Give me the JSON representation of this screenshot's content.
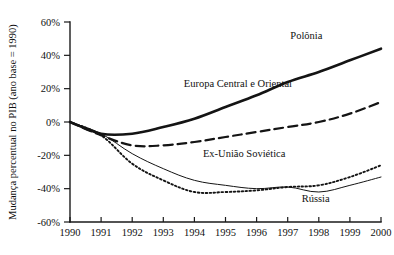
{
  "chart_data": {
    "type": "line",
    "title": "",
    "subtitle": "",
    "xlabel": "",
    "ylabel": "Mudança percentual no PIB (ano base = 1990)",
    "x": [
      1990,
      1991,
      1992,
      1993,
      1994,
      1995,
      1996,
      1997,
      1998,
      1999,
      2000
    ],
    "categories": [
      "1990",
      "1991",
      "1992",
      "1993",
      "1994",
      "1995",
      "1996",
      "1997",
      "1998",
      "1999",
      "2000"
    ],
    "xlim": [
      1990,
      2000
    ],
    "ylim": [
      -60,
      60
    ],
    "y_ticks": [
      60,
      40,
      20,
      0,
      -20,
      -40,
      -60
    ],
    "y_tick_labels": [
      "60%",
      "40%",
      "20%",
      "0%",
      "-20%",
      "-40%",
      "-60%"
    ],
    "grid": false,
    "legend_position": "inline-labels",
    "series": [
      {
        "name": "Polônia",
        "style": "solid-thick",
        "label_x": 1997.6,
        "label_y": 50,
        "values": [
          0,
          -7,
          -7,
          -3,
          2,
          9,
          16,
          24,
          30,
          37,
          44
        ]
      },
      {
        "name": "Europa Central e Oriental",
        "style": "dashed",
        "label_x": 1995.4,
        "label_y": 21,
        "values": [
          0,
          -8,
          -14,
          -14,
          -12,
          -9,
          -6,
          -3,
          0,
          5,
          12
        ]
      },
      {
        "name": "Ex-União Soviética",
        "style": "dotted",
        "label_x": 1995.6,
        "label_y": -21,
        "values": [
          0,
          -8,
          -25,
          -35,
          -42,
          -42,
          -41,
          -39,
          -38,
          -33,
          -26
        ]
      },
      {
        "name": "Rússia",
        "style": "solid-thin",
        "label_x": 1997.9,
        "label_y": -48,
        "values": [
          0,
          -7,
          -19,
          -28,
          -35,
          -38,
          -40,
          -39,
          -42,
          -38,
          -33
        ]
      }
    ]
  },
  "axes": {
    "y_axis_label": "Mudança percentual no PIB (ano base = 1990)"
  }
}
